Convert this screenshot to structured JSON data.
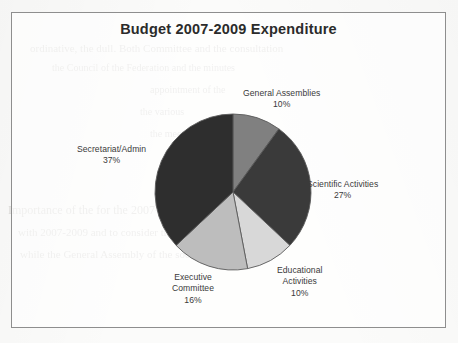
{
  "scan": {
    "ghost_lines": [
      "ordinative, the dull. Both Committee and the consultation",
      "the Council of the Federation and the minutes",
      "appointment of the",
      "the various",
      "the meeting",
      "Importance of the                                        for the  2007-2009",
      "with  2007-2009 and to consider the issue of the seat of",
      "while  the  General  Assembly  of  the  societies"
    ]
  },
  "chart": {
    "title": "Budget 2007-2009 Expenditure"
  },
  "chart_data": {
    "type": "pie",
    "title": "Budget 2007-2009 Expenditure",
    "xlabel": "",
    "ylabel": "",
    "units": "percent",
    "start_angle_deg": 0,
    "direction": "clockwise",
    "legend": "none",
    "labels_position": "outside",
    "total": 100,
    "categories": [
      "General Assemblies",
      "Scientific Activities",
      "Educational Activities",
      "Executive Committee",
      "Secretariat/Admin"
    ],
    "values": [
      10,
      27,
      10,
      16,
      37
    ],
    "value_labels": [
      "10%",
      "27%",
      "10%",
      "16%",
      "37%"
    ],
    "colors": [
      "#808080",
      "#3a3a3a",
      "#d8d8d8",
      "#bdbdbd",
      "#2e2e2e"
    ],
    "slices": [
      {
        "name": "General Assemblies",
        "label_lines": [
          "General Assemblies"
        ],
        "value": 10,
        "value_label": "10%",
        "color": "#808080"
      },
      {
        "name": "Scientific Activities",
        "label_lines": [
          "Scientific Activities"
        ],
        "value": 27,
        "value_label": "27%",
        "color": "#3a3a3a"
      },
      {
        "name": "Educational Activities",
        "label_lines": [
          "Educational",
          "Activities"
        ],
        "value": 10,
        "value_label": "10%",
        "color": "#d8d8d8"
      },
      {
        "name": "Executive Committee",
        "label_lines": [
          "Executive",
          "Committee"
        ],
        "value": 16,
        "value_label": "16%",
        "color": "#bdbdbd"
      },
      {
        "name": "Secretariat/Admin",
        "label_lines": [
          "Secretariat/Admin"
        ],
        "value": 37,
        "value_label": "37%",
        "color": "#2e2e2e"
      }
    ]
  },
  "labels": {
    "general": {
      "line1": "General Assemblies",
      "pct": "10%"
    },
    "scientific": {
      "line1": "Scientific Activities",
      "pct": "27%"
    },
    "educational": {
      "line1": "Educational",
      "line2": "Activities",
      "pct": "10%"
    },
    "executive": {
      "line1": "Executive",
      "line2": "Committee",
      "pct": "16%"
    },
    "secretariat": {
      "line1": "Secretariat/Admin",
      "pct": "37%"
    }
  }
}
